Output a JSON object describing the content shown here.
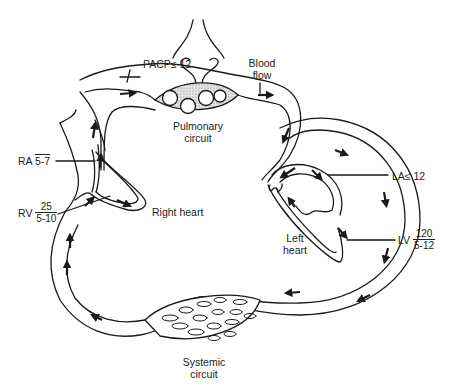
{
  "diagram": {
    "labels": {
      "pacp": "PACP≤ 12",
      "blood_flow_line1": "Blood",
      "blood_flow_line2": "flow",
      "pulmonary_line1": "Pulmonary",
      "pulmonary_line2": "circuit",
      "ra_name": "RA",
      "ra_value": "5-7",
      "rv_name": "RV",
      "rv_systolic": "25",
      "rv_diastolic": "5-10",
      "right_heart": "Right heart",
      "la": "LA≤ 12",
      "left_heart_line1": "Left",
      "left_heart_line2": "heart",
      "lv_name": "LV",
      "lv_systolic": "120",
      "lv_diastolic": "5-12",
      "systemic_line1": "Systemic",
      "systemic_line2": "circuit"
    },
    "colors": {
      "stroke": "#1a1a1a",
      "capillary_fill": "#d9d9d9",
      "background": "#ffffff"
    }
  }
}
